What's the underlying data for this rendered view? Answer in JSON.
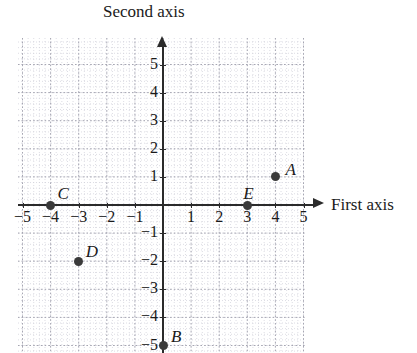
{
  "figure": {
    "background_color": "#ffffff",
    "axis_color": "#2b2b2b",
    "grid_color": "#b9b9c2",
    "point_color": "#3a3a3a"
  },
  "axes": {
    "x_title": "First axis",
    "y_title": "Second axis",
    "x_arrow": "arrow-right-icon",
    "y_arrow": "arrow-up-icon",
    "x_ticks": [
      "−5",
      "−4",
      "−3",
      "−2",
      "−1",
      "1",
      "2",
      "3",
      "4",
      "5"
    ],
    "y_ticks": [
      "5",
      "4",
      "3",
      "2",
      "1",
      "−1",
      "−2",
      "−3",
      "−4",
      "−5"
    ]
  },
  "chart_data": {
    "type": "scatter",
    "title": "",
    "xlabel": "First axis",
    "ylabel": "Second axis",
    "xlim": [
      -5.2,
      5.3
    ],
    "ylim": [
      -5.7,
      5.8
    ],
    "xticks": [
      -5,
      -4,
      -3,
      -2,
      -1,
      1,
      2,
      3,
      4,
      5
    ],
    "yticks": [
      5,
      4,
      3,
      2,
      1,
      -1,
      -2,
      -3,
      -4,
      -5
    ],
    "grid": true,
    "minor_grid": true,
    "legend": "none",
    "points": [
      {
        "label": "A",
        "x": 4,
        "y": 1,
        "label_dx": 10,
        "label_dy": -17
      },
      {
        "label": "B",
        "x": 0,
        "y": -5,
        "label_dx": 8,
        "label_dy": -19
      },
      {
        "label": "C",
        "x": -4,
        "y": 0,
        "label_dx": 7,
        "label_dy": -21
      },
      {
        "label": "D",
        "x": -3,
        "y": -2,
        "label_dx": 7,
        "label_dy": -19
      },
      {
        "label": "E",
        "x": 3,
        "y": 0,
        "label_dx": -4,
        "label_dy": -21
      }
    ]
  }
}
